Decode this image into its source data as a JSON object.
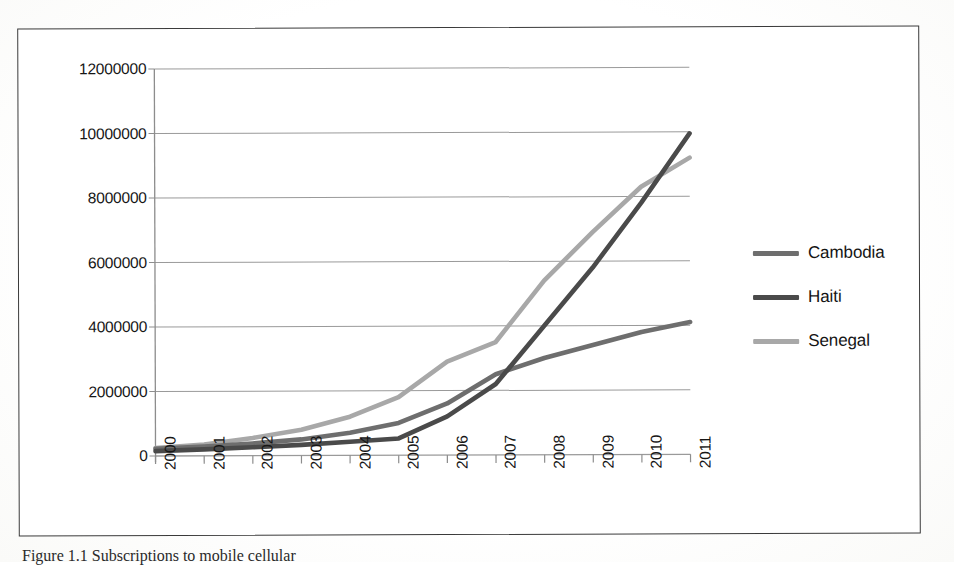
{
  "figure": {
    "caption": "Figure 1.1 Subscriptions to mobile cellular",
    "border_color": "#3a3a3a"
  },
  "legend": {
    "position": "right",
    "items": [
      {
        "label": "Cambodia",
        "color": "#6e6e6e",
        "swatch_name": "legend-swatch-cambodia"
      },
      {
        "label": "Haiti",
        "color": "#4a4a4a",
        "swatch_name": "legend-swatch-haiti"
      },
      {
        "label": "Senegal",
        "color": "#a8a8a8",
        "swatch_name": "legend-swatch-senegal"
      }
    ]
  },
  "axes": {
    "y_ticks": [
      "0",
      "2000000",
      "4000000",
      "6000000",
      "8000000",
      "10000000",
      "12000000"
    ],
    "x_ticks": [
      "2000",
      "2001",
      "2002",
      "2003",
      "2004",
      "2005",
      "2006",
      "2007",
      "2008",
      "2009",
      "2010",
      "2011"
    ]
  },
  "chart_data": {
    "type": "line",
    "title": "",
    "subtitle": "",
    "xlabel": "",
    "ylabel": "",
    "categories": [
      "2000",
      "2001",
      "2002",
      "2003",
      "2004",
      "2005",
      "2006",
      "2007",
      "2008",
      "2009",
      "2010",
      "2011"
    ],
    "x": [
      2000,
      2001,
      2002,
      2003,
      2004,
      2005,
      2006,
      2007,
      2008,
      2009,
      2010,
      2011
    ],
    "ylim": [
      0,
      12000000
    ],
    "xlim": [
      2000,
      2011
    ],
    "ytick_step": 2000000,
    "grid": "horizontal",
    "legend_position": "right",
    "series": [
      {
        "name": "Cambodia",
        "color": "#6e6e6e",
        "values": [
          220000,
          290000,
          380000,
          500000,
          700000,
          1000000,
          1600000,
          2500000,
          3000000,
          3400000,
          3800000,
          4100000
        ]
      },
      {
        "name": "Haiti",
        "color": "#4a4a4a",
        "values": [
          150000,
          200000,
          260000,
          330000,
          420000,
          520000,
          1200000,
          2200000,
          4000000,
          5800000,
          7800000,
          9950000
        ]
      },
      {
        "name": "Senegal",
        "color": "#a8a8a8",
        "values": [
          250000,
          350000,
          550000,
          800000,
          1200000,
          1800000,
          2900000,
          3500000,
          5400000,
          6900000,
          8300000,
          9200000
        ]
      }
    ]
  }
}
